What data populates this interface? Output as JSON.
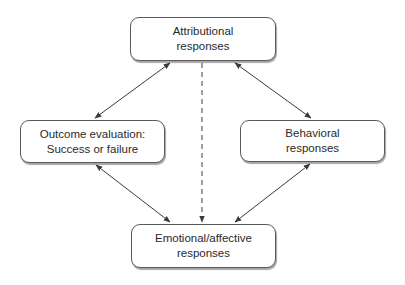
{
  "diagram": {
    "nodes": [
      {
        "id": "attributional",
        "lines": [
          "Attributional",
          "responses"
        ]
      },
      {
        "id": "outcome",
        "lines": [
          "Outcome evaluation:",
          "Success or failure"
        ]
      },
      {
        "id": "behavioral",
        "lines": [
          "Behavioral",
          "responses"
        ]
      },
      {
        "id": "emotional",
        "lines": [
          "Emotional/affective",
          "responses"
        ]
      }
    ],
    "edges": [
      {
        "from": "attributional",
        "to": "outcome",
        "style": "solid",
        "direction": "both"
      },
      {
        "from": "attributional",
        "to": "behavioral",
        "style": "solid",
        "direction": "both"
      },
      {
        "from": "outcome",
        "to": "emotional",
        "style": "solid",
        "direction": "both"
      },
      {
        "from": "behavioral",
        "to": "emotional",
        "style": "solid",
        "direction": "both"
      },
      {
        "from": "attributional",
        "to": "emotional",
        "style": "dashed",
        "direction": "forward"
      }
    ],
    "colors": {
      "line": "#3a3a3a",
      "box_border": "#5a5a5a",
      "text": "#2a2a2a"
    }
  }
}
